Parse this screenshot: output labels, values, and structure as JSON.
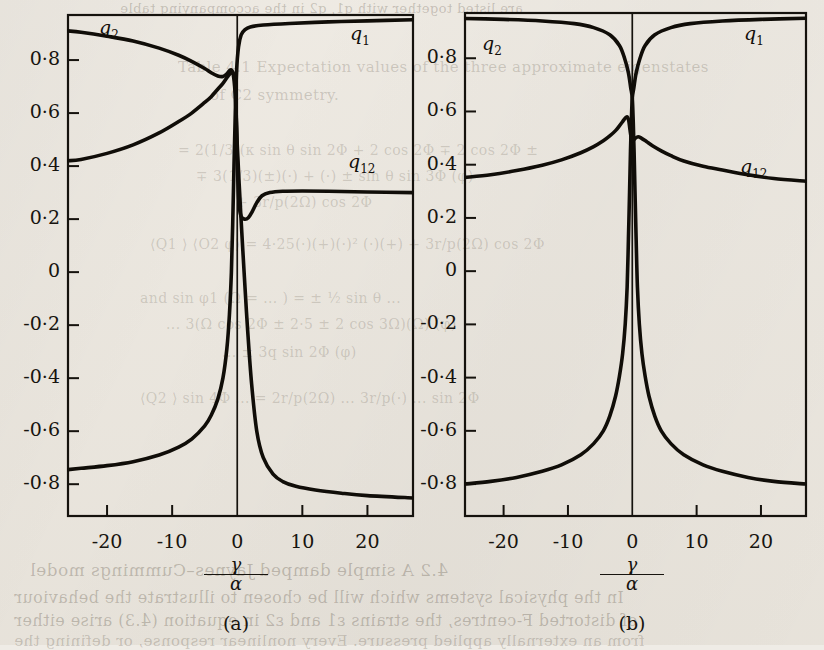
{
  "figure": {
    "axis_label_numerator": "γ",
    "axis_label_denominator": "α",
    "y_ticks": [
      "0·8",
      "0·6",
      "0·4",
      "0·2",
      "0",
      "-0·2",
      "-0·4",
      "-0·6",
      "-0·8"
    ],
    "y_tick_values": [
      0.8,
      0.6,
      0.4,
      0.2,
      0,
      -0.2,
      -0.4,
      -0.6,
      -0.8
    ],
    "x_ticks": [
      "-20",
      "-10",
      "0",
      "10",
      "20"
    ],
    "x_tick_values": [
      -20,
      -10,
      0,
      10,
      20
    ],
    "panels": [
      {
        "caption": "(a)",
        "labels": {
          "q1": "q",
          "q1_sub": "1",
          "q2": "q",
          "q2_sub": "2",
          "q12": "q",
          "q12_sub": "12"
        }
      },
      {
        "caption": "(b)",
        "labels": {
          "q1": "q",
          "q1_sub": "1",
          "q2": "q",
          "q2_sub": "2",
          "q12": "q",
          "q12_sub": "12"
        }
      }
    ]
  },
  "page_bleed": {
    "top": "are listed together with  q1, q2  in the accompanying table",
    "l1": "Table 4.1  Expectation values of the three approximate eigenstates",
    "l2": "of C2 symmetry.",
    "l3": "= 2(1/3)(κ sin θ sin 2Φ + 2 cos 2Φ ∓ 2 cos 2Φ ±",
    "l4": "∓ 3(1/3)(±)(·) + (·) ± sin θ sin 3Φ (φ)",
    "l5": "+ 3r/p(2Ω) cos 2Φ",
    "l6": "⟨Q1 ⟩ ⟨O2 φ⟩   = 4·25(·)(+)(·)² (·)(+) + 3r/p(2Ω) cos 2Φ",
    "l7": "and sin φ1 (Ω = ... ) = ± ½ sin θ ...",
    "l8": "... 3(Ω cos 2Φ ± 2·5 ± 2 cos 3Ω)(Ω) (φ)",
    "l9": "... ± 3q sin 2Φ (φ)",
    "l10": "⟨Q2 ⟩ sin 4Φ ... = 2r/p(2Ω) ... 3r/p(·) ... sin 2Φ",
    "b1": "4.2  A simple damped Jaynes–Cummings model",
    "b2": "In the physical systems which will be chosen to illustrate the behaviour",
    "b3": "of distorted F-centres, the strains ε1 and ε2 in equation (4.3) arise either",
    "b4": "from an externally applied pressure. Every nonlinear response, or defining the"
  },
  "chart_data": [
    {
      "type": "line",
      "title": "(a)",
      "xlabel": "γ/α",
      "ylabel": "",
      "xlim": [
        -26,
        27
      ],
      "ylim": [
        -0.92,
        0.97
      ],
      "grid": false,
      "series": [
        {
          "name": "q1",
          "points": [
            [
              -26,
              -0.745
            ],
            [
              -24,
              -0.74
            ],
            [
              -20,
              -0.73
            ],
            [
              -16,
              -0.715
            ],
            [
              -12,
              -0.69
            ],
            [
              -9,
              -0.66
            ],
            [
              -7,
              -0.63
            ],
            [
              -5,
              -0.58
            ],
            [
              -4,
              -0.54
            ],
            [
              -3,
              -0.48
            ],
            [
              -2.2,
              -0.4
            ],
            [
              -1.6,
              -0.29
            ],
            [
              -1.2,
              -0.16
            ],
            [
              -0.9,
              0.0
            ],
            [
              -0.7,
              0.18
            ],
            [
              -0.5,
              0.4
            ],
            [
              -0.3,
              0.6
            ],
            [
              -0.1,
              0.76
            ],
            [
              0.2,
              0.85
            ],
            [
              0.6,
              0.895
            ],
            [
              1.2,
              0.915
            ],
            [
              2,
              0.925
            ],
            [
              4,
              0.932
            ],
            [
              8,
              0.938
            ],
            [
              14,
              0.944
            ],
            [
              20,
              0.948
            ],
            [
              27,
              0.952
            ]
          ]
        },
        {
          "name": "q2",
          "points": [
            [
              -26,
              0.91
            ],
            [
              -24,
              0.905
            ],
            [
              -20,
              0.89
            ],
            [
              -16,
              0.872
            ],
            [
              -12,
              0.845
            ],
            [
              -9,
              0.818
            ],
            [
              -7,
              0.795
            ],
            [
              -5,
              0.768
            ],
            [
              -4,
              0.752
            ],
            [
              -3,
              0.74
            ],
            [
              -2.2,
              0.738
            ],
            [
              -1.6,
              0.748
            ],
            [
              -1.1,
              0.762
            ],
            [
              -0.7,
              0.755
            ],
            [
              -0.4,
              0.7
            ],
            [
              -0.2,
              0.61
            ],
            [
              0,
              0.48
            ],
            [
              0.3,
              0.33
            ],
            [
              0.7,
              0.15
            ],
            [
              1.1,
              -0.02
            ],
            [
              1.6,
              -0.22
            ],
            [
              2.2,
              -0.42
            ],
            [
              3,
              -0.6
            ],
            [
              4,
              -0.7
            ],
            [
              5.5,
              -0.762
            ],
            [
              7,
              -0.79
            ],
            [
              9,
              -0.808
            ],
            [
              12,
              -0.822
            ],
            [
              16,
              -0.834
            ],
            [
              20,
              -0.843
            ],
            [
              27,
              -0.852
            ]
          ]
        },
        {
          "name": "q12",
          "points": [
            [
              -26,
              0.42
            ],
            [
              -24,
              0.425
            ],
            [
              -20,
              0.448
            ],
            [
              -16,
              0.48
            ],
            [
              -12,
              0.525
            ],
            [
              -9,
              0.568
            ],
            [
              -7,
              0.6
            ],
            [
              -5,
              0.64
            ],
            [
              -4,
              0.662
            ],
            [
              -3,
              0.69
            ],
            [
              -2.2,
              0.712
            ],
            [
              -1.4,
              0.74
            ],
            [
              -0.8,
              0.752
            ],
            [
              -0.4,
              0.735
            ],
            [
              -0.2,
              0.64
            ],
            [
              -0.05,
              0.48
            ],
            [
              0.1,
              0.34
            ],
            [
              0.3,
              0.25
            ],
            [
              0.6,
              0.21
            ],
            [
              1.1,
              0.2
            ],
            [
              1.7,
              0.205
            ],
            [
              2.3,
              0.228
            ],
            [
              3,
              0.262
            ],
            [
              3.8,
              0.288
            ],
            [
              5,
              0.3
            ],
            [
              7,
              0.305
            ],
            [
              10,
              0.306
            ],
            [
              14,
              0.305
            ],
            [
              20,
              0.302
            ],
            [
              27,
              0.3
            ]
          ]
        }
      ]
    },
    {
      "type": "line",
      "title": "(b)",
      "xlabel": "γ/α",
      "ylabel": "",
      "xlim": [
        -26,
        27
      ],
      "ylim": [
        -0.92,
        0.97
      ],
      "grid": false,
      "series": [
        {
          "name": "q1",
          "points": [
            [
              -26,
              -0.8
            ],
            [
              -22,
              -0.79
            ],
            [
              -18,
              -0.775
            ],
            [
              -14,
              -0.752
            ],
            [
              -11,
              -0.728
            ],
            [
              -8,
              -0.69
            ],
            [
              -6,
              -0.648
            ],
            [
              -4.5,
              -0.6
            ],
            [
              -3.5,
              -0.545
            ],
            [
              -2.6,
              -0.47
            ],
            [
              -2,
              -0.395
            ],
            [
              -1.5,
              -0.31
            ],
            [
              -1.1,
              -0.2
            ],
            [
              -0.8,
              -0.06
            ],
            [
              -0.6,
              0.12
            ],
            [
              -0.42,
              0.3
            ],
            [
              -0.28,
              0.45
            ],
            [
              -0.15,
              0.56
            ],
            [
              0,
              0.65
            ],
            [
              0.25,
              0.69
            ],
            [
              0.6,
              0.745
            ],
            [
              1.2,
              0.8
            ],
            [
              2,
              0.848
            ],
            [
              3.5,
              0.888
            ],
            [
              6,
              0.915
            ],
            [
              9,
              0.93
            ],
            [
              14,
              0.94
            ],
            [
              20,
              0.946
            ],
            [
              27,
              0.95
            ]
          ]
        },
        {
          "name": "q2",
          "points": [
            [
              -27,
              0.95
            ],
            [
              -20,
              0.946
            ],
            [
              -14,
              0.94
            ],
            [
              -9,
              0.93
            ],
            [
              -6,
              0.915
            ],
            [
              -3.5,
              0.888
            ],
            [
              -2,
              0.848
            ],
            [
              -1.2,
              0.8
            ],
            [
              -0.6,
              0.745
            ],
            [
              -0.25,
              0.69
            ],
            [
              0,
              0.65
            ],
            [
              0.15,
              0.56
            ],
            [
              0.28,
              0.45
            ],
            [
              0.42,
              0.3
            ],
            [
              0.6,
              0.12
            ],
            [
              0.8,
              -0.06
            ],
            [
              1.1,
              -0.2
            ],
            [
              1.5,
              -0.31
            ],
            [
              2,
              -0.395
            ],
            [
              2.6,
              -0.47
            ],
            [
              3.5,
              -0.545
            ],
            [
              4.5,
              -0.6
            ],
            [
              6,
              -0.648
            ],
            [
              8,
              -0.69
            ],
            [
              11,
              -0.728
            ],
            [
              14,
              -0.752
            ],
            [
              18,
              -0.775
            ],
            [
              22,
              -0.79
            ],
            [
              27,
              -0.8
            ]
          ]
        },
        {
          "name": "q12",
          "points": [
            [
              -26,
              0.352
            ],
            [
              -22,
              0.362
            ],
            [
              -18,
              0.378
            ],
            [
              -14,
              0.398
            ],
            [
              -11,
              0.418
            ],
            [
              -8,
              0.445
            ],
            [
              -6,
              0.468
            ],
            [
              -4.5,
              0.49
            ],
            [
              -3.5,
              0.508
            ],
            [
              -2.6,
              0.528
            ],
            [
              -2,
              0.546
            ],
            [
              -1.5,
              0.562
            ],
            [
              -1.1,
              0.575
            ],
            [
              -0.8,
              0.58
            ],
            [
              -0.55,
              0.566
            ],
            [
              -0.35,
              0.53
            ],
            [
              -0.15,
              0.5
            ],
            [
              0,
              0.492
            ],
            [
              0.2,
              0.492
            ],
            [
              0.5,
              0.5
            ],
            [
              0.9,
              0.505
            ],
            [
              1.4,
              0.5
            ],
            [
              2.2,
              0.487
            ],
            [
              3.2,
              0.47
            ],
            [
              4.5,
              0.452
            ],
            [
              6,
              0.434
            ],
            [
              8,
              0.414
            ],
            [
              11,
              0.394
            ],
            [
              14,
              0.38
            ],
            [
              18,
              0.362
            ],
            [
              22,
              0.348
            ],
            [
              27,
              0.338
            ]
          ]
        }
      ]
    }
  ]
}
